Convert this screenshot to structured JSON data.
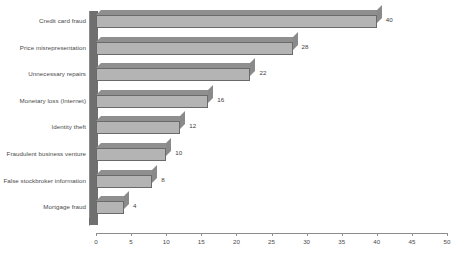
{
  "chart_data": {
    "type": "bar",
    "orientation": "horizontal",
    "title": "",
    "subtitle": "",
    "xlabel": "",
    "ylabel": "",
    "xlim": [
      0,
      50
    ],
    "xticks": [
      0,
      5,
      10,
      15,
      20,
      25,
      30,
      35,
      40,
      45,
      50
    ],
    "grid": false,
    "legend": false,
    "style": "3d-bar",
    "categories": [
      "Credit card fraud",
      "Price misrepresentation",
      "Unnecessary repairs",
      "Monetary loss (Internet)",
      "Identity theft",
      "Fraudulent business venture",
      "False stockbroker information",
      "Mortgage fraud"
    ],
    "values": [
      40,
      28,
      22,
      16,
      12,
      10,
      8,
      4
    ],
    "value_labels": [
      "40",
      "28",
      "22",
      "16",
      "12",
      "10",
      "8",
      "4"
    ],
    "colors": {
      "bar_face": "#b4b4b4",
      "bar_top": "#8f8f8f",
      "bar_cap": "#8a8a8a",
      "bar_outline": "#6a6a6a",
      "axis_wall": "#6f6f6f",
      "axis_line": "#8d8d8d",
      "text": "#4a4a4a",
      "background": "#ffffff"
    }
  },
  "axis": {
    "tick_labels": [
      "0",
      "5",
      "10",
      "15",
      "20",
      "25",
      "30",
      "35",
      "40",
      "45",
      "50"
    ]
  }
}
